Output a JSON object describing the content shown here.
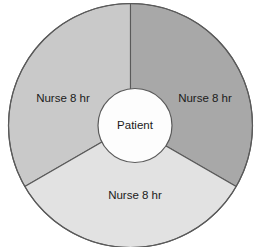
{
  "diagram": {
    "name": "patient-centered-nursing-coverage-donut",
    "background_color": "#ffffff",
    "stroke_color": "#5a5a5a",
    "center": {
      "label": "Patient",
      "fill": "#fdfdfd",
      "text_color": "#1b1b1b"
    },
    "segments": [
      {
        "id": "left",
        "label": "Nurse 8 hr",
        "fill": "#c9c9c9",
        "start_angle_deg": 90,
        "end_angle_deg": 210,
        "span_deg": 120,
        "label_x": 63,
        "label_y": 99
      },
      {
        "id": "right",
        "label": "Nurse 8 hr",
        "fill": "#a8a8a8",
        "start_angle_deg": 330,
        "end_angle_deg": 90,
        "span_deg": 120,
        "label_x": 205,
        "label_y": 99
      },
      {
        "id": "bottom",
        "label": "Nurse 8 hr",
        "fill": "#e2e2e2",
        "start_angle_deg": 210,
        "end_angle_deg": 330,
        "span_deg": 120,
        "label_x": 135,
        "label_y": 196
      }
    ]
  },
  "chart_data": {
    "type": "pie",
    "title": "",
    "xlabel": "",
    "ylabel": "",
    "categories": [
      "Nurse 8 hr",
      "Nurse 8 hr",
      "Nurse 8 hr"
    ],
    "values": [
      8,
      8,
      8
    ],
    "units": "hours",
    "total": 24,
    "center_label": "Patient",
    "colors": [
      "#c9c9c9",
      "#a8a8a8",
      "#e2e2e2"
    ],
    "legend": "none",
    "grid": false
  }
}
